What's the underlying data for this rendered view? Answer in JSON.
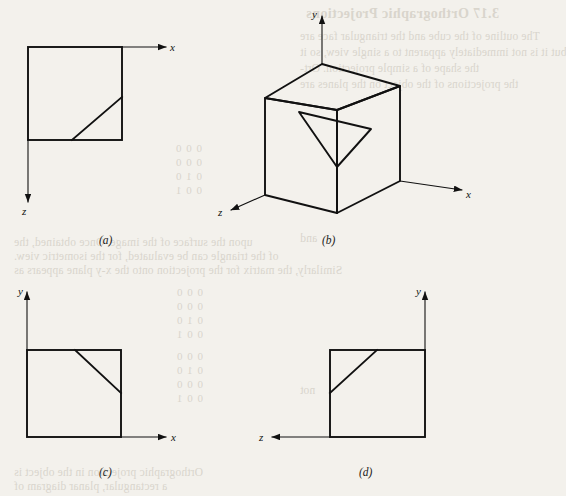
{
  "figure": {
    "panels": [
      {
        "id": "a",
        "caption": "(a)",
        "view": "top view",
        "axes": [
          {
            "name": "x",
            "label": "x",
            "direction": "right"
          },
          {
            "name": "z",
            "label": "z",
            "direction": "down"
          }
        ]
      },
      {
        "id": "b",
        "caption": "(b)",
        "view": "pictorial isometric view of object",
        "axes": [
          {
            "name": "y",
            "label": "y",
            "direction": "up"
          },
          {
            "name": "x",
            "label": "x",
            "direction": "right"
          },
          {
            "name": "z",
            "label": "z",
            "direction": "left-down"
          }
        ]
      },
      {
        "id": "c",
        "caption": "(c)",
        "view": "front view",
        "axes": [
          {
            "name": "y",
            "label": "y",
            "direction": "up"
          },
          {
            "name": "x",
            "label": "x",
            "direction": "right"
          }
        ]
      },
      {
        "id": "d",
        "caption": "(d)",
        "view": "side view",
        "axes": [
          {
            "name": "y",
            "label": "y",
            "direction": "up"
          },
          {
            "name": "z",
            "label": "z",
            "direction": "left"
          }
        ]
      }
    ],
    "colors": {
      "ink": "#111111",
      "paper": "#f3f1ec",
      "bleed": "#d9d5cc"
    }
  },
  "bleed_text": {
    "heading": "3.17 Orthographic Projections",
    "lines": [
      "The outline of the cube and the triangular face are",
      "but it is not immediately apparent to a single view, so it",
      "the shape of a simple projection. Ort-",
      "the projections of the object on the planes are",
      "the projections are"
    ],
    "mid_lines": [
      "upon the surface of the image. Once obtained, the",
      "of the triangle can be evaluated, for the isometric view.",
      "Similarly, the matrix for the projection onto the x-y plane appears as"
    ],
    "lower_lines": [
      "Orthographic projection in the object is",
      "a rectangular, planar diagram of"
    ],
    "matrix_rows": [
      "0 0 0",
      "0 0 0",
      "0 1 0",
      "0 0 1"
    ],
    "fragment_and": "and",
    "fragment_not": "not"
  }
}
